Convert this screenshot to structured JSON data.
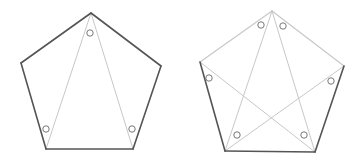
{
  "diagram": {
    "colors": {
      "dark_edge": "#555555",
      "light_edge": "#c8c8c8",
      "circle": "#777777"
    },
    "figures": [
      {
        "name": "left-pentagon",
        "vertices": [
          [
            91,
            13
          ],
          [
            161,
            66
          ],
          [
            133,
            149
          ],
          [
            46,
            149
          ],
          [
            21,
            63
          ]
        ],
        "dark_edges": [
          [
            0,
            1
          ],
          [
            1,
            2
          ],
          [
            2,
            3
          ],
          [
            3,
            4
          ],
          [
            4,
            0
          ]
        ],
        "light_lines": [
          [
            0,
            3
          ],
          [
            0,
            2
          ]
        ],
        "circles": [
          [
            90,
            33
          ],
          [
            46,
            129
          ],
          [
            132,
            129
          ]
        ]
      },
      {
        "name": "right-pentagon",
        "vertices": [
          [
            272,
            11
          ],
          [
            344,
            66
          ],
          [
            315,
            152
          ],
          [
            225,
            151
          ],
          [
            200,
            62
          ]
        ],
        "dark_edges": [
          [
            1,
            2
          ],
          [
            2,
            3
          ],
          [
            3,
            4
          ]
        ],
        "light_edges": [
          [
            0,
            1
          ],
          [
            4,
            0
          ]
        ],
        "light_lines": [
          [
            0,
            3
          ],
          [
            0,
            2
          ],
          [
            4,
            2
          ],
          [
            1,
            3
          ]
        ],
        "circles": [
          [
            261,
            25
          ],
          [
            283,
            26
          ],
          [
            209,
            78
          ],
          [
            331,
            81
          ],
          [
            237,
            135
          ],
          [
            304,
            135
          ]
        ]
      }
    ]
  }
}
